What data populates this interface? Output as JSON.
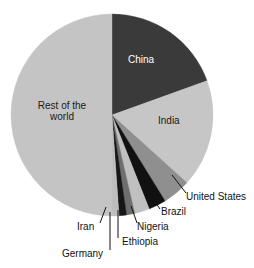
{
  "chart_data": {
    "type": "pie",
    "title": "",
    "subtitle": "",
    "xlabel": "",
    "ylabel": "",
    "legend_position": "none",
    "grid": false,
    "categories": [
      "China",
      "India",
      "United States",
      "Brazil",
      "Nigeria",
      "Ethiopia",
      "Germany",
      "Iran",
      "Rest of the world"
    ],
    "values": [
      19.5,
      17.2,
      4.5,
      2.8,
      2.4,
      1.3,
      1.2,
      1.1,
      50.0
    ],
    "units": "percent of total",
    "colors": [
      "#3a3a3a",
      "#c6c6c6",
      "#8f8f8f",
      "#111111",
      "#c0c0c0",
      "#6e6e6e",
      "#161616",
      "#bdbdbd",
      "#c4c4c4"
    ],
    "start_angle_deg": 0,
    "direction": "clockwise"
  },
  "pie": {
    "center_x": 112,
    "center_y": 115,
    "radius": 101,
    "slices": [
      {
        "name": "China",
        "start_deg": 0,
        "end_deg": 70.2,
        "fill": "#3a3a3a",
        "label": "China",
        "label_on_dark": true,
        "label_x": 128,
        "label_y": 59,
        "has_callout": false
      },
      {
        "name": "India",
        "start_deg": 70.2,
        "end_deg": 132.1,
        "fill": "#c6c6c6",
        "label": "India",
        "label_on_dark": false,
        "label_x": 158,
        "label_y": 120,
        "has_callout": false
      },
      {
        "name": "United States",
        "start_deg": 132.1,
        "end_deg": 148.3,
        "fill": "#8f8f8f",
        "label": "United States",
        "label_on_dark": false,
        "has_callout": true,
        "callout_x": 186,
        "callout_y": 196,
        "leader_from_x": 172,
        "leader_from_y": 175,
        "leader_to_x": 186,
        "leader_to_y": 193
      },
      {
        "name": "Brazil",
        "start_deg": 148.3,
        "end_deg": 158.4,
        "fill": "#111111",
        "label": "Brazil",
        "label_on_dark": false,
        "has_callout": true,
        "callout_x": 161,
        "callout_y": 211,
        "leader_from_x": 151,
        "leader_from_y": 196,
        "leader_to_x": 160,
        "leader_to_y": 209
      },
      {
        "name": "Nigeria",
        "start_deg": 158.4,
        "end_deg": 167.0,
        "fill": "#c0c0c0",
        "label": "Nigeria",
        "label_on_dark": false,
        "has_callout": true,
        "callout_x": 135,
        "callout_y": 226,
        "leader_from_x": 131,
        "leader_from_y": 206,
        "leader_to_x": 137,
        "leader_to_y": 223
      },
      {
        "name": "Ethiopia",
        "start_deg": 167.0,
        "end_deg": 171.7,
        "fill": "#6e6e6e",
        "label": "Ethiopia",
        "label_on_dark": false,
        "has_callout": true,
        "callout_x": 116,
        "callout_y": 240,
        "leader_from_x": 118,
        "leader_from_y": 210,
        "leader_to_x": 118,
        "leader_to_y": 238
      },
      {
        "name": "Germany",
        "start_deg": 171.7,
        "end_deg": 176.0,
        "fill": "#161616",
        "label": "Germany",
        "label_on_dark": false,
        "has_callout": true,
        "callout_x": 66,
        "callout_y": 252,
        "leader_from_x": 110,
        "leader_from_y": 212,
        "leader_to_x": 110,
        "leader_to_y": 250
      },
      {
        "name": "Iran",
        "start_deg": 176.0,
        "end_deg": 180.0,
        "fill": "#bdbdbd",
        "label": "Iran",
        "label_on_dark": false,
        "has_callout": true,
        "callout_x": 84,
        "callout_y": 226,
        "leader_from_x": 106,
        "leader_from_y": 207,
        "leader_to_x": 100,
        "leader_to_y": 223
      },
      {
        "name": "Rest of the world",
        "start_deg": 180.0,
        "end_deg": 360.0,
        "fill": "#c4c4c4",
        "label_line1": "Rest of the",
        "label_line2": "world",
        "label_on_dark": false,
        "label_x": 36,
        "label_y": 106,
        "has_callout": false
      }
    ]
  }
}
